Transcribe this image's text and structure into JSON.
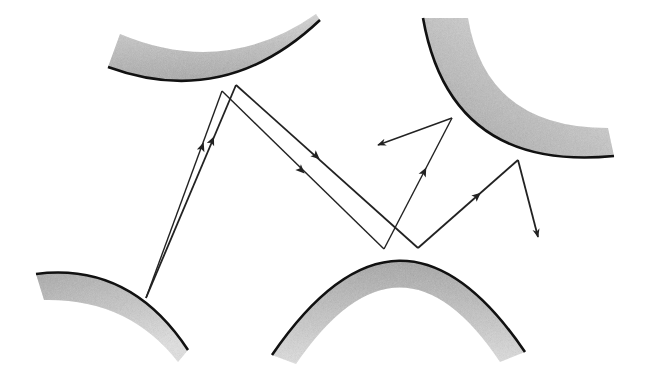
{
  "diagram": {
    "type": "ray-reflection-between-curved-surfaces",
    "background": "#ffffff",
    "surface_fill": "#b8b8b8",
    "edge_color": "#111111",
    "ray_color": "#222222",
    "surfaces": [
      {
        "id": "top-left",
        "edge": "M108,67 Q225,110 320,20",
        "thick_outer": "M108,67 Q225,110 320,20 L318,14 Q225,80 118,30 Z"
      },
      {
        "id": "top-right",
        "edge": "M423,18 Q450,170 612,158",
        "thick_outer": "M423,18 Q450,170 612,158 L605,130 Q480,125 470,18 Z"
      },
      {
        "id": "bottom-left",
        "edge": "M36,274 Q130,265 188,350",
        "thick_outer": "M36,274 Q130,265 188,350 L178,362 Q130,295 44,300 Z"
      },
      {
        "id": "bottom-middle",
        "edge": "M272,355 Q400,170 525,352",
        "thick_outer": "M272,355 Q400,170 525,352 L498,360 Q400,210 296,362 Z"
      }
    ],
    "rays": [
      {
        "from": [
          146,
          298
        ],
        "to": [
          222,
          91
        ],
        "arrow_at": [
          204,
          147
        ],
        "dir": "up"
      },
      {
        "from": [
          146,
          298
        ],
        "to": [
          236,
          85
        ],
        "arrow_at": [
          213,
          140
        ],
        "dir": "up"
      },
      {
        "from": [
          222,
          91
        ],
        "to": [
          384,
          249
        ],
        "arrow_at": [
          300,
          169
        ]
      },
      {
        "from": [
          236,
          85
        ],
        "to": [
          418,
          248
        ],
        "arrow_at": [
          316,
          157
        ]
      },
      {
        "from": [
          384,
          249
        ],
        "to": [
          452,
          118
        ],
        "arrow_at": [
          424,
          170
        ]
      },
      {
        "from": [
          418,
          248
        ],
        "to": [
          518,
          160
        ],
        "arrow_at": [
          478,
          195
        ]
      },
      {
        "from": [
          452,
          118
        ],
        "to": [
          378,
          145
        ],
        "arrow_at": [
          378,
          145
        ],
        "end_arrow": true
      },
      {
        "from": [
          518,
          160
        ],
        "to": [
          538,
          237
        ],
        "arrow_at": [
          538,
          237
        ],
        "end_arrow": true
      }
    ]
  }
}
